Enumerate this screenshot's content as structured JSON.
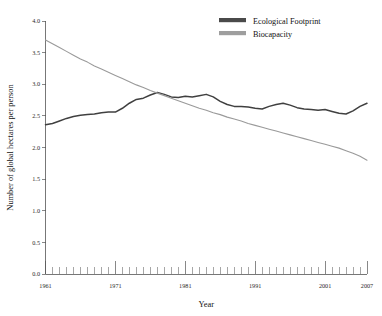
{
  "chart_data": {
    "type": "line",
    "title": "",
    "xlabel": "Year",
    "ylabel": "Number of global hectares per person",
    "xlim": [
      1961,
      2007
    ],
    "ylim": [
      0.0,
      4.0
    ],
    "grid": false,
    "legend_position": "top-right",
    "y_ticks": [
      "0.0",
      "0.5",
      "1.0",
      "1.5",
      "2.0",
      "2.5",
      "3.0",
      "3.5",
      "4.0"
    ],
    "y_tick_values": [
      0.0,
      0.5,
      1.0,
      1.5,
      2.0,
      2.5,
      3.0,
      3.5,
      4.0
    ],
    "x_ticks": [
      "1961",
      "1971",
      "1981",
      "1991",
      "2001",
      "2007"
    ],
    "x_tick_values": [
      1961,
      1971,
      1981,
      1991,
      2001,
      2007
    ],
    "x_minor_step": 1,
    "x": [
      1961,
      1962,
      1963,
      1964,
      1965,
      1966,
      1967,
      1968,
      1969,
      1970,
      1971,
      1972,
      1973,
      1974,
      1975,
      1976,
      1977,
      1978,
      1979,
      1980,
      1981,
      1982,
      1983,
      1984,
      1985,
      1986,
      1987,
      1988,
      1989,
      1990,
      1991,
      1992,
      1993,
      1994,
      1995,
      1996,
      1997,
      1998,
      1999,
      2000,
      2001,
      2002,
      2003,
      2004,
      2005,
      2006,
      2007
    ],
    "series": [
      {
        "name": "Ecological Footprint",
        "color": "#404040",
        "width": 1.5,
        "values": [
          2.36,
          2.38,
          2.42,
          2.46,
          2.49,
          2.51,
          2.52,
          2.53,
          2.55,
          2.56,
          2.56,
          2.62,
          2.7,
          2.76,
          2.78,
          2.83,
          2.87,
          2.84,
          2.8,
          2.79,
          2.81,
          2.8,
          2.82,
          2.84,
          2.8,
          2.73,
          2.68,
          2.65,
          2.65,
          2.64,
          2.62,
          2.61,
          2.65,
          2.68,
          2.7,
          2.67,
          2.63,
          2.61,
          2.6,
          2.59,
          2.6,
          2.57,
          2.54,
          2.53,
          2.58,
          2.65,
          2.7
        ]
      },
      {
        "name": "Biocapacity",
        "color": "#9a9a9a",
        "width": 1.1,
        "values": [
          3.7,
          3.64,
          3.58,
          3.52,
          3.46,
          3.4,
          3.35,
          3.29,
          3.24,
          3.19,
          3.14,
          3.09,
          3.04,
          2.99,
          2.95,
          2.9,
          2.86,
          2.82,
          2.78,
          2.74,
          2.7,
          2.66,
          2.62,
          2.59,
          2.55,
          2.52,
          2.48,
          2.45,
          2.42,
          2.38,
          2.35,
          2.32,
          2.29,
          2.26,
          2.23,
          2.2,
          2.17,
          2.14,
          2.11,
          2.08,
          2.05,
          2.02,
          1.99,
          1.95,
          1.91,
          1.86,
          1.8
        ]
      }
    ]
  },
  "legend": {
    "items": [
      {
        "label": "Ecological Footprint",
        "swatch": "#4a4a4a"
      },
      {
        "label": "Biocapacity",
        "swatch": "#9e9e9e"
      }
    ]
  },
  "axes": {
    "x_title": "Year",
    "y_title": "Number of global hectares per person"
  }
}
